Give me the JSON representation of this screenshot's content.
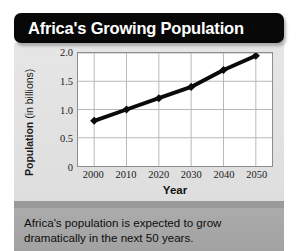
{
  "title": "Africa's Growing Population",
  "caption": "Africa's population is expected to grow dramatically in the next 50 years.",
  "axis": {
    "ylabel_bold": "Population",
    "ylabel_unit": " (in billions)",
    "xlabel": "Year"
  },
  "colors": {
    "banner_bg": "#080808",
    "banner_text": "#ffffff",
    "panel_bg": "#e3e3e3",
    "plot_bg": "#ffffff",
    "gridline": "#b9b9b9",
    "line": "#0a0a0a",
    "caption_bg": "#a9a9a9",
    "separator": "#9a9a9a"
  },
  "chart_data": {
    "type": "line",
    "title": "Africa's Growing Population",
    "xlabel": "Year",
    "ylabel": "Population (in billions)",
    "x": [
      2000,
      2010,
      2020,
      2030,
      2040,
      2050
    ],
    "values": [
      0.8,
      1.0,
      1.2,
      1.4,
      1.7,
      1.95
    ],
    "xtick_labels": [
      "2000",
      "2010",
      "2020",
      "2030",
      "2040",
      "2050"
    ],
    "ytick_labels": [
      "0",
      "0.5",
      "1.0",
      "1.5",
      "2.0"
    ],
    "ytick_values": [
      0,
      0.5,
      1.0,
      1.5,
      2.0
    ],
    "xlim": [
      1995,
      2055
    ],
    "ylim": [
      0,
      2.0
    ],
    "grid": true,
    "legend": "none",
    "marker": "diamond",
    "series": [
      {
        "name": "Africa population",
        "values": [
          0.8,
          1.0,
          1.2,
          1.4,
          1.7,
          1.95
        ]
      }
    ]
  }
}
